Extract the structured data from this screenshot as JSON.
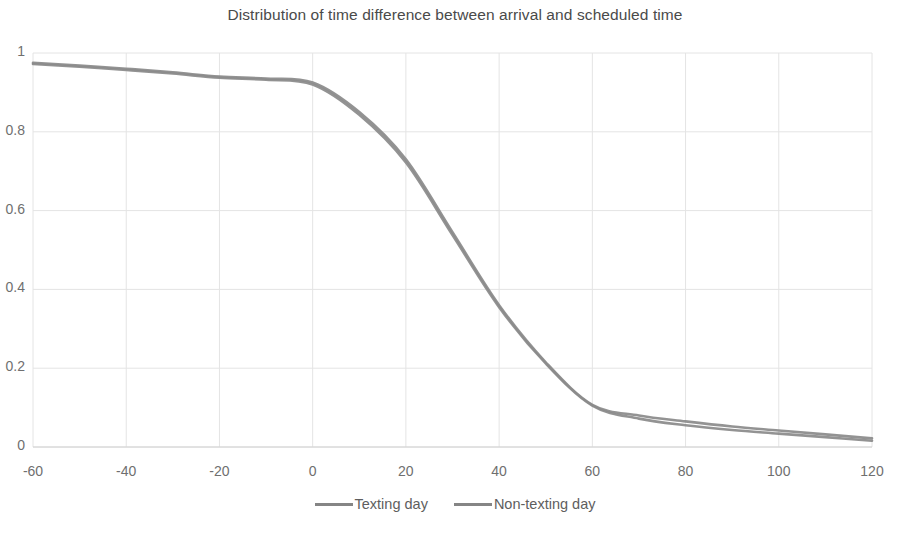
{
  "chart_data": {
    "type": "line",
    "title": "Distribution of time difference between arrival and scheduled time",
    "subtitle": "",
    "xlabel": "",
    "ylabel": "",
    "xlim": [
      -60,
      120
    ],
    "ylim": [
      0,
      1
    ],
    "xticks": [
      -60,
      -40,
      -20,
      0,
      20,
      40,
      60,
      80,
      100,
      120
    ],
    "xtick_labels": [
      "-60",
      "-40",
      "-20",
      "0",
      "20",
      "40",
      "60",
      "80",
      "100",
      "120"
    ],
    "yticks": [
      0,
      0.2,
      0.4,
      0.6,
      0.8,
      1
    ],
    "ytick_labels": [
      "0",
      "0.2",
      "0.4",
      "0.6",
      "0.8",
      "1"
    ],
    "grid": true,
    "legend_position": "bottom",
    "x": [
      -60,
      -50,
      -40,
      -30,
      -20,
      -10,
      0,
      10,
      20,
      30,
      40,
      50,
      60,
      70,
      80,
      90,
      100,
      110,
      120
    ],
    "series": [
      {
        "name": "Texting day",
        "color": "#8a8a8a",
        "values": [
          0.975,
          0.968,
          0.96,
          0.951,
          0.94,
          0.935,
          0.925,
          0.85,
          0.73,
          0.545,
          0.36,
          0.215,
          0.107,
          0.08,
          0.065,
          0.052,
          0.042,
          0.032,
          0.022
        ]
      },
      {
        "name": "Non-texting day",
        "color": "#8a8a8a",
        "values": [
          0.972,
          0.965,
          0.957,
          0.948,
          0.937,
          0.932,
          0.92,
          0.843,
          0.722,
          0.538,
          0.355,
          0.212,
          0.105,
          0.072,
          0.055,
          0.043,
          0.034,
          0.025,
          0.016
        ]
      }
    ]
  },
  "legend": {
    "entries": [
      {
        "label": "Texting day"
      },
      {
        "label": "Non-texting day"
      }
    ]
  },
  "axes": {
    "y_labels": [
      "1",
      "0.8",
      "0.6",
      "0.4",
      "0.2",
      "0"
    ],
    "x_labels": [
      "-60",
      "-40",
      "-20",
      "0",
      "20",
      "40",
      "60",
      "80",
      "100",
      "120"
    ]
  },
  "colors": {
    "series_line": "#8a8a8a",
    "gridline": "#e4e4e4",
    "text": "#5e5e5e",
    "title": "#4a4a4a",
    "background": "#ffffff"
  }
}
